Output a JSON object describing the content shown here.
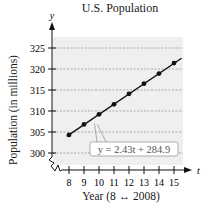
{
  "chart_data": {
    "type": "line",
    "title": "U.S. Population",
    "xlabel": "Year (8 ↔ 2008)",
    "ylabel": "Population (in millions)",
    "x_axis_var": "t",
    "y_axis_var": "y",
    "x": [
      8,
      9,
      10,
      11,
      12,
      13,
      14,
      15
    ],
    "x_tick_labels": [
      "8",
      "9",
      "10",
      "11",
      "12",
      "13",
      "14",
      "15"
    ],
    "y_ticks": [
      300,
      305,
      310,
      315,
      320,
      325
    ],
    "y_tick_labels": [
      "300",
      "305",
      "310",
      "315",
      "320",
      "325"
    ],
    "series": [
      {
        "name": "U.S. Population",
        "values": [
          304.3,
          306.8,
          309.2,
          311.6,
          314.1,
          316.5,
          318.9,
          321.4
        ],
        "marker": "circle",
        "color": "#111111"
      }
    ],
    "annotation": {
      "text": "y = 2.43t + 284.9",
      "equation": {
        "slope": 2.43,
        "intercept": 284.9
      }
    },
    "xlim": [
      7.6,
      15.5
    ],
    "ylim": [
      300,
      328
    ],
    "axis_break": true,
    "grid": {
      "horizontal": true,
      "style": "dashed"
    },
    "background_color": "#efefef",
    "legend": "none"
  }
}
